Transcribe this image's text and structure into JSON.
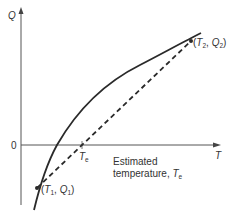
{
  "diagram": {
    "axes": {
      "y_label": "Q",
      "x_label": "T",
      "origin_label": "0"
    },
    "points": [
      {
        "id": "p1",
        "label_var1": "T",
        "sub1": "1",
        "label_var2": "Q",
        "sub2": "1"
      },
      {
        "id": "p2",
        "label_var1": "T",
        "sub1": "2",
        "label_var2": "Q",
        "sub2": "2"
      }
    ],
    "intercept_label": {
      "var": "T",
      "sub": "e"
    },
    "annotation": {
      "line1": "Estimated",
      "line2": "temperature, ",
      "var": "T",
      "sub": "e"
    },
    "curves": [
      {
        "name": "actual-curve",
        "style": "solid"
      },
      {
        "name": "secant-line",
        "style": "dashed"
      }
    ],
    "colors": {
      "line": "#2a2a2a",
      "axis": "#555555"
    }
  }
}
